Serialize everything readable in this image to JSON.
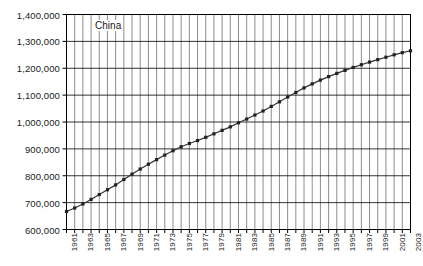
{
  "chart_data": {
    "type": "line",
    "title": "",
    "series_label": "China",
    "xlabel": "",
    "ylabel": "",
    "ylim": [
      600000,
      1400000
    ],
    "ytick_step": 100000,
    "grid": true,
    "legend_position": "inside-top-left",
    "marker": "square",
    "line_color": "#333333",
    "grid_color": "#808080",
    "axis_color": "#000000",
    "ytick_labels": [
      "1,400,000",
      "1,300,000",
      "1,200,000",
      "1,100,000",
      "1,000,000",
      "900,000",
      "800,000",
      "700,000",
      "600,000"
    ],
    "ytick_values": [
      1400000,
      1300000,
      1200000,
      1100000,
      1000000,
      900000,
      800000,
      700000,
      600000
    ],
    "xtick_labels": [
      "1961",
      "1963",
      "1965",
      "1967",
      "1969",
      "1971",
      "1973",
      "1975",
      "1977",
      "1979",
      "1981",
      "1983",
      "1985",
      "1987",
      "1989",
      "1991",
      "1993",
      "1995",
      "1997",
      "1999",
      "2001",
      "2003"
    ],
    "x": [
      1961,
      1962,
      1963,
      1964,
      1965,
      1966,
      1967,
      1968,
      1969,
      1970,
      1971,
      1972,
      1973,
      1974,
      1975,
      1976,
      1977,
      1978,
      1979,
      1980,
      1981,
      1982,
      1983,
      1984,
      1985,
      1986,
      1987,
      1988,
      1989,
      1990,
      1991,
      1992,
      1993,
      1994,
      1995,
      1996,
      1997,
      1998,
      1999,
      2000,
      2001,
      2002,
      2003
    ],
    "values": [
      667000,
      680000,
      695000,
      712000,
      730000,
      748000,
      766000,
      786000,
      806000,
      825000,
      843000,
      860000,
      877000,
      893000,
      908000,
      920000,
      931000,
      943000,
      956000,
      969000,
      982000,
      997000,
      1011000,
      1026000,
      1041000,
      1058000,
      1075000,
      1093000,
      1110000,
      1127000,
      1142000,
      1156000,
      1169000,
      1181000,
      1192000,
      1203000,
      1213000,
      1223000,
      1232000,
      1241000,
      1250000,
      1258000,
      1265000
    ],
    "end_value": 1320000,
    "start_value": 667000
  }
}
